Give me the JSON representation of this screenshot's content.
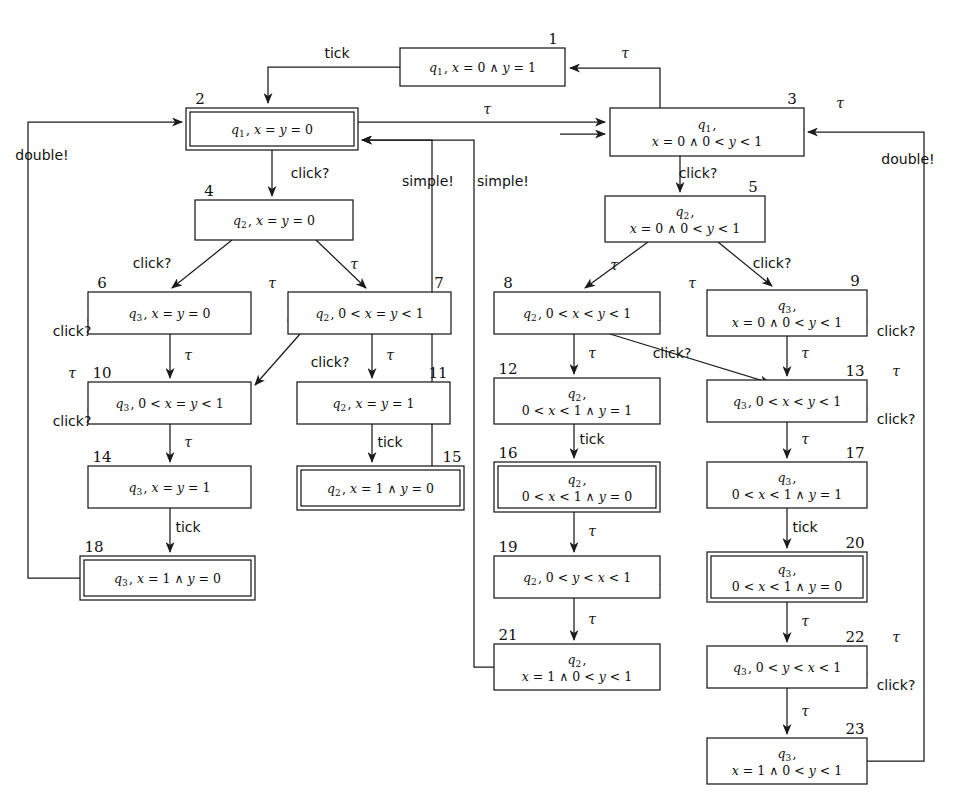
{
  "figure": {
    "type": "state-transition-diagram",
    "accepting_marker": "double-border",
    "colors": {
      "stroke": "#1b1b1b",
      "background": "#ffffff"
    }
  },
  "glyphs": {
    "tau": "τ",
    "and": "∧",
    "lt": "<",
    "eq": "="
  },
  "nodes": [
    {
      "id": "1",
      "num": "1",
      "x": 400,
      "y": 48,
      "w": 165,
      "h": 38,
      "double": false,
      "lines": [
        "q1, x = 0 ∧ y = 1"
      ],
      "q": "q1"
    },
    {
      "id": "2",
      "num": "2",
      "x": 186,
      "y": 108,
      "w": 172,
      "h": 42,
      "double": true,
      "lines": [
        "q1, x = y = 0"
      ],
      "q": "q1"
    },
    {
      "id": "3",
      "num": "3",
      "x": 610,
      "y": 108,
      "w": 194,
      "h": 48,
      "double": false,
      "lines": [
        "q1,",
        "x = 0 ∧ 0 < y < 1"
      ],
      "q": "q1"
    },
    {
      "id": "4",
      "num": "4",
      "x": 195,
      "y": 200,
      "w": 158,
      "h": 40,
      "double": false,
      "lines": [
        "q2, x = y = 0"
      ],
      "q": "q2"
    },
    {
      "id": "5",
      "num": "5",
      "x": 605,
      "y": 196,
      "w": 160,
      "h": 46,
      "double": false,
      "lines": [
        "q2,",
        "x = 0 ∧ 0 < y < 1"
      ],
      "q": "q2"
    },
    {
      "id": "6",
      "num": "6",
      "x": 88,
      "y": 292,
      "w": 163,
      "h": 42,
      "double": false,
      "lines": [
        "q3, x = y = 0"
      ],
      "q": "q3"
    },
    {
      "id": "7",
      "num": "7",
      "x": 288,
      "y": 292,
      "w": 163,
      "h": 42,
      "double": false,
      "lines": [
        "q2, 0 < x = y < 1"
      ],
      "q": "q2"
    },
    {
      "id": "8",
      "num": "8",
      "x": 494,
      "y": 292,
      "w": 166,
      "h": 42,
      "double": false,
      "lines": [
        "q2, 0 < x < y < 1"
      ],
      "q": "q2"
    },
    {
      "id": "9",
      "num": "9",
      "x": 707,
      "y": 290,
      "w": 160,
      "h": 46,
      "double": false,
      "lines": [
        "q3,",
        "x = 0 ∧ 0 < y < 1"
      ],
      "q": "q3"
    },
    {
      "id": "10",
      "num": "10",
      "x": 88,
      "y": 382,
      "w": 163,
      "h": 42,
      "double": false,
      "lines": [
        "q3, 0 < x = y < 1"
      ],
      "q": "q3"
    },
    {
      "id": "11",
      "num": "11",
      "x": 297,
      "y": 382,
      "w": 153,
      "h": 42,
      "double": false,
      "lines": [
        "q2, x = y = 1"
      ],
      "q": "q2"
    },
    {
      "id": "12",
      "num": "12",
      "x": 494,
      "y": 378,
      "w": 166,
      "h": 46,
      "double": false,
      "lines": [
        "q2,",
        "0 < x < 1 ∧ y = 1"
      ],
      "q": "q2"
    },
    {
      "id": "13",
      "num": "13",
      "x": 707,
      "y": 380,
      "w": 160,
      "h": 42,
      "double": false,
      "lines": [
        "q3, 0 < x < y < 1"
      ],
      "q": "q3"
    },
    {
      "id": "14",
      "num": "14",
      "x": 88,
      "y": 466,
      "w": 163,
      "h": 42,
      "double": false,
      "lines": [
        "q3, x = y = 1"
      ],
      "q": "q3"
    },
    {
      "id": "15",
      "num": "15",
      "x": 297,
      "y": 466,
      "w": 167,
      "h": 44,
      "double": true,
      "lines": [
        "q2, x = 1 ∧ y = 0"
      ],
      "q": "q2"
    },
    {
      "id": "16",
      "num": "16",
      "x": 494,
      "y": 462,
      "w": 166,
      "h": 50,
      "double": true,
      "lines": [
        "q2,",
        "0 < x < 1 ∧ y = 0"
      ],
      "q": "q2"
    },
    {
      "id": "17",
      "num": "17",
      "x": 707,
      "y": 462,
      "w": 160,
      "h": 46,
      "double": false,
      "lines": [
        "q3,",
        "0 < x < 1 ∧ y = 1"
      ],
      "q": "q3"
    },
    {
      "id": "18",
      "num": "18",
      "x": 80,
      "y": 556,
      "w": 175,
      "h": 44,
      "double": true,
      "lines": [
        "q3, x = 1 ∧ y = 0"
      ],
      "q": "q3"
    },
    {
      "id": "19",
      "num": "19",
      "x": 494,
      "y": 556,
      "w": 166,
      "h": 42,
      "double": false,
      "lines": [
        "q2, 0 < y < x < 1"
      ],
      "q": "q2"
    },
    {
      "id": "20",
      "num": "20",
      "x": 707,
      "y": 552,
      "w": 160,
      "h": 50,
      "double": true,
      "lines": [
        "q3,",
        "0 < x < 1 ∧ y = 0"
      ],
      "q": "q3"
    },
    {
      "id": "21",
      "num": "21",
      "x": 494,
      "y": 644,
      "w": 166,
      "h": 46,
      "double": false,
      "lines": [
        "q2,",
        "x = 1 ∧ 0 < y < 1"
      ],
      "q": "q2"
    },
    {
      "id": "22",
      "num": "22",
      "x": 707,
      "y": 646,
      "w": 160,
      "h": 42,
      "double": false,
      "lines": [
        "q3, 0 < y < x < 1"
      ],
      "q": "q3"
    },
    {
      "id": "23",
      "num": "23",
      "x": 707,
      "y": 738,
      "w": 160,
      "h": 46,
      "double": false,
      "lines": [
        "q3,",
        "x = 1 ∧ 0 < y < 1"
      ],
      "q": "q3"
    }
  ],
  "edge_labels": {
    "tick_1_to_2": "tick",
    "tau_3_to_1": "τ",
    "tau_2_to_3": "τ",
    "click_2_to_4": "click?",
    "click_4_to_6": "click?",
    "tau_4_to_7": "τ",
    "self_6": "click?",
    "self_7": "τ",
    "tau_6_to_10": "τ",
    "click_7_to_10": "click?",
    "tau_7_to_11": "τ",
    "self_10_tau": "τ",
    "self_10_click": "click?",
    "tau_10_to_14": "τ",
    "tick_11_to_15": "tick",
    "tick_14_to_18": "tick",
    "double_18_to_2": "double!",
    "simple_15_to_2": "simple!",
    "simple_21_to_2": "simple!",
    "self_3": "τ",
    "click_3_to_5": "click?",
    "tau_5_to_8": "τ",
    "click_5_to_9": "click?",
    "self_8": "τ",
    "self_9": "click?",
    "tau_8_to_12": "τ",
    "click_8_to_13": "click?",
    "tau_9_to_13": "τ",
    "self_13_tau": "τ",
    "self_13_click": "click?",
    "tick_12_to_16": "tick",
    "tau_16_to_19": "τ",
    "tau_19_to_21": "τ",
    "tau_13_to_17": "τ",
    "tick_17_to_20": "tick",
    "tau_20_to_22": "τ",
    "self_22_tau": "τ",
    "self_22_click": "click?",
    "tau_22_to_23": "τ",
    "double_23_to_3": "double!"
  }
}
